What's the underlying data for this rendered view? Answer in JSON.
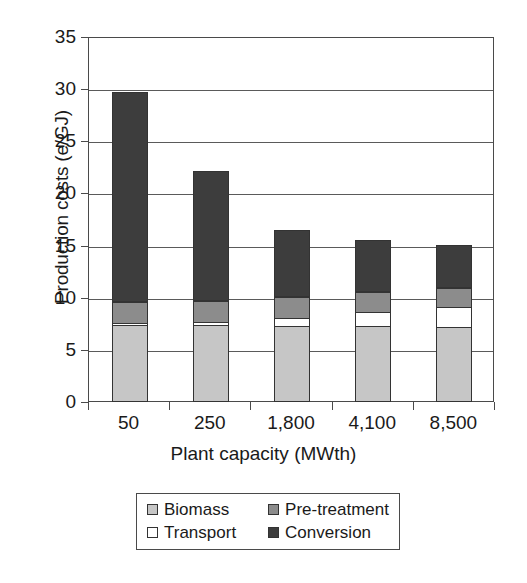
{
  "chart_data": {
    "type": "bar",
    "stacked": true,
    "title": "",
    "xlabel": "Plant capacity (MWth)",
    "ylabel": "Production costs (e/GJ)",
    "categories": [
      "50",
      "250",
      "1,800",
      "4,100",
      "8,500"
    ],
    "ylim": [
      0,
      35
    ],
    "yticks": [
      0,
      5,
      10,
      15,
      20,
      25,
      30,
      35
    ],
    "ytick_labels": [
      "0",
      "5",
      "10",
      "15",
      "20",
      "25",
      "30",
      "35"
    ],
    "grid": true,
    "legend_position": "below-axes",
    "series": [
      {
        "name": "Biomass",
        "color": "#c6c6c6",
        "values": [
          7.4,
          7.4,
          7.3,
          7.3,
          7.2
        ]
      },
      {
        "name": "Transport",
        "color": "#ffffff",
        "values": [
          0.3,
          0.4,
          0.9,
          1.5,
          2.0
        ]
      },
      {
        "name": "Pre-treatment",
        "color": "#8c8c8c",
        "values": [
          2.1,
          2.1,
          2.1,
          2.0,
          2.0
        ]
      },
      {
        "name": "Conversion",
        "color": "#3d3d3d",
        "values": [
          20.2,
          12.5,
          6.4,
          5.0,
          4.1
        ]
      }
    ],
    "totals": [
      30.0,
      22.4,
      16.7,
      15.8,
      15.3
    ],
    "annotations": []
  },
  "legend": {
    "items": [
      {
        "label": "Biomass",
        "swatch": "#c6c6c6"
      },
      {
        "label": "Pre-treatment",
        "swatch": "#8c8c8c"
      },
      {
        "label": "Transport",
        "swatch": "#ffffff"
      },
      {
        "label": "Conversion",
        "swatch": "#3d3d3d"
      }
    ]
  }
}
